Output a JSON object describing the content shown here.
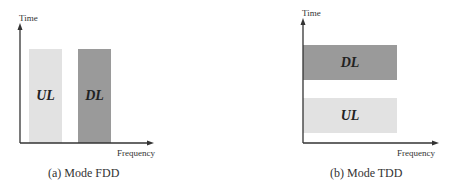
{
  "panels": [
    {
      "id": "fdd",
      "y_axis_label": "Time",
      "x_axis_label": "Frequency",
      "caption": "(a) Mode FDD",
      "blocks": [
        {
          "label": "UL",
          "color": "#e2e2e2",
          "orientation": "vertical"
        },
        {
          "label": "DL",
          "color": "#9a9a9a",
          "orientation": "vertical"
        }
      ]
    },
    {
      "id": "tdd",
      "y_axis_label": "Time",
      "x_axis_label": "Frequency",
      "caption": "(b) Mode TDD",
      "blocks": [
        {
          "label": "DL",
          "color": "#9a9a9a",
          "orientation": "horizontal"
        },
        {
          "label": "UL",
          "color": "#e2e2e2",
          "orientation": "horizontal"
        }
      ]
    }
  ],
  "colors": {
    "axis": "#333333",
    "ul_fill": "#e2e2e2",
    "dl_fill": "#9a9a9a",
    "background": "#ffffff"
  }
}
